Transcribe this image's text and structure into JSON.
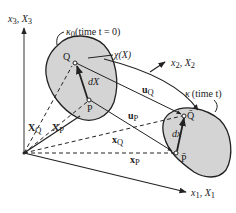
{
  "diagram": {
    "type": "continuum-deformation-mapping",
    "axes": {
      "x3": {
        "var": "x",
        "sub": "3",
        "ref": "X",
        "refsub": "3"
      },
      "x2": {
        "var": "x",
        "sub": "2",
        "ref": "X",
        "refsub": "2"
      },
      "x1": {
        "var": "x",
        "sub": "1",
        "ref": "X",
        "refsub": "1"
      }
    },
    "reference_config": {
      "symbol": "κ",
      "sub": "0",
      "caption": "(time t = 0)",
      "points": {
        "Q": "Q",
        "P": "P"
      },
      "element": "dX"
    },
    "current_config": {
      "symbol": "κ",
      "caption": "(time t)",
      "points": {
        "Q": "Q̄",
        "P": "P̄"
      },
      "element": "dx"
    },
    "mapping_label": "χ(X)",
    "vectors": {
      "X_Q": {
        "sym": "X",
        "sub": "Q"
      },
      "X_P": {
        "sym": "X",
        "sub": "P"
      },
      "x_Q": {
        "sym": "x",
        "sub": "Q"
      },
      "x_P": {
        "sym": "x",
        "sub": "P"
      },
      "u_Q": {
        "sym": "u",
        "sub": "Q"
      },
      "u_P": {
        "sym": "u",
        "sub": "P"
      }
    },
    "colors": {
      "body_fill": "#d4d4d4",
      "stroke": "#222222",
      "background": "#ffffff"
    }
  }
}
